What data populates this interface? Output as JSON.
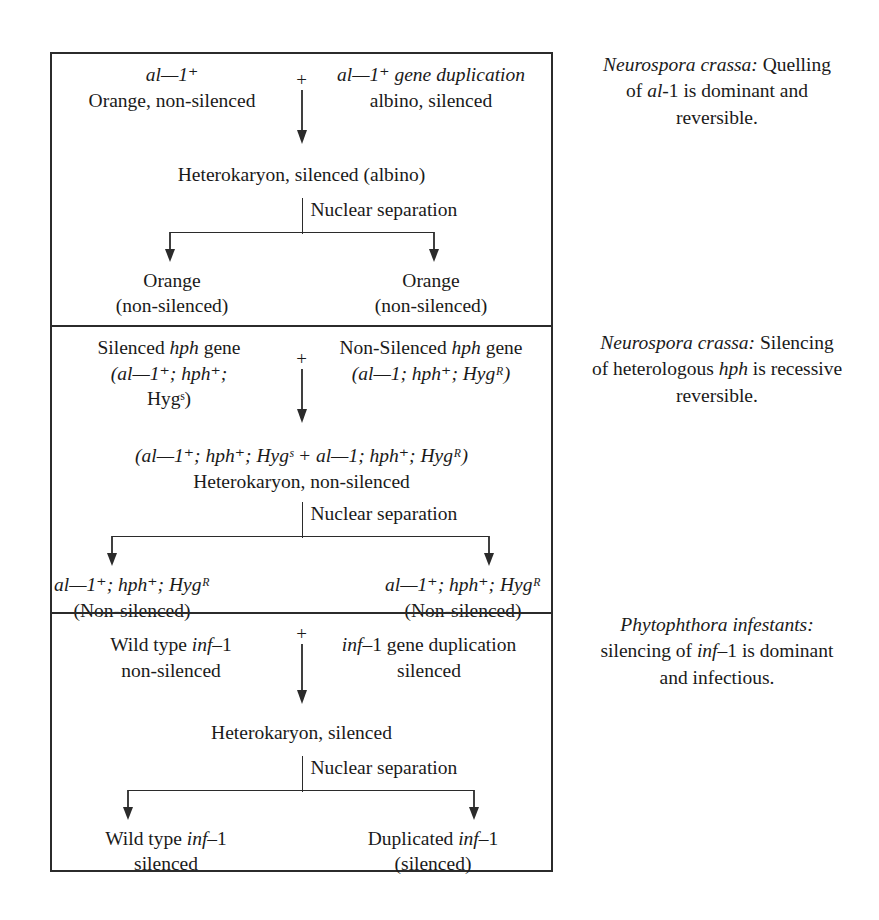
{
  "diagram": {
    "split_label": "Nuclear separation",
    "plus": "+",
    "panels": [
      {
        "id": "neurospora-al1",
        "parent_left": {
          "line1": "al—1⁺",
          "line2": "Orange, non-silenced"
        },
        "parent_right": {
          "line1": "al—1⁺ gene duplication",
          "line2": "albino, silenced"
        },
        "heterokaryon": "Heterokaryon, silenced (albino)",
        "outcome_left": {
          "line1": "Orange",
          "line2": "(non-silenced)"
        },
        "outcome_right": {
          "line1": "Orange",
          "line2": "(non-silenced)"
        },
        "caption": {
          "organism": "Neurospora crassa:",
          "line1_rest": " Quelling",
          "line2_a": "of ",
          "line2_gene": "al",
          "line2_b": "-1 is dominant and",
          "line3": "reversible."
        }
      },
      {
        "id": "neurospora-hph",
        "parent_left": {
          "line1a": "Silenced ",
          "line1gene": "hph",
          "line1b": " gene",
          "line2": "(al—1⁺; hph⁺;",
          "line3": "Hygˢ)"
        },
        "parent_right": {
          "line1a": "Non-Silenced ",
          "line1gene": "hph",
          "line1b": " gene",
          "line2": "(al—1; hph⁺; Hygᴿ)"
        },
        "genotype_line": "(al—1⁺; hph⁺; Hygˢ + al—1; hph⁺; Hygᴿ)",
        "heterokaryon": "Heterokaryon, non-silenced",
        "outcome_left": {
          "line1": "al—1⁺; hph⁺; Hygᴿ",
          "line2": "(Non-silenced)"
        },
        "outcome_right": {
          "line1": "al—1⁺; hph⁺; Hygᴿ",
          "line2": "(Non-silenced)"
        },
        "caption": {
          "organism": "Neurospora crassa:",
          "line1_rest": " Silencing",
          "line2_a": "of heterologous ",
          "line2_gene": "hph",
          "line2_b": " is recessive",
          "line3": "reversible."
        }
      },
      {
        "id": "phytophthora-inf1",
        "parent_left": {
          "line1a": "Wild type ",
          "line1gene": "inf",
          "line1b": "–1",
          "line2": "non-silenced"
        },
        "parent_right": {
          "line1gene": "inf",
          "line1b": "–1 gene duplication",
          "line2": "silenced"
        },
        "heterokaryon": "Heterokaryon, silenced",
        "outcome_left": {
          "line1a": "Wild type ",
          "line1gene": "inf",
          "line1b": "–1",
          "line2": "silenced"
        },
        "outcome_right": {
          "line1a": "Duplicated ",
          "line1gene": "inf",
          "line1b": "–1",
          "line2": "(silenced)"
        },
        "caption": {
          "organism": "Phytophthora infestants:",
          "line2_a": "silencing of ",
          "line2_gene": "inf",
          "line2_b": "–1 is dominant",
          "line3": "and infectious."
        }
      }
    ]
  },
  "colors": {
    "ink": "#1a1a1a",
    "rule": "#2b2b2b",
    "background": "#ffffff"
  }
}
